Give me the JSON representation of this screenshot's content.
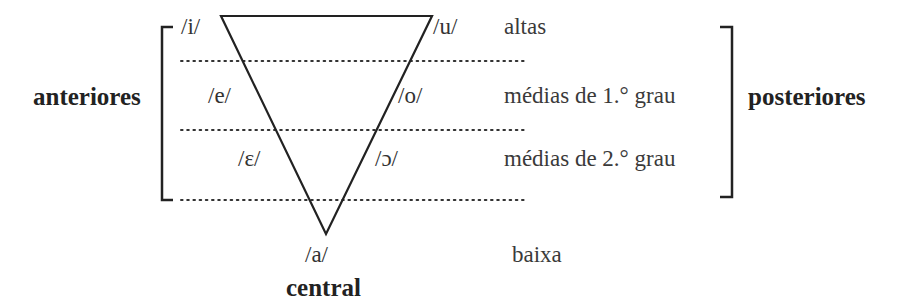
{
  "diagram": {
    "side_labels": {
      "left": "anteriores",
      "right": "posteriores",
      "bottom": "central"
    },
    "vowels": {
      "i": "/i/",
      "u": "/u/",
      "e": "/e/",
      "o": "/o/",
      "open_e": "/ɛ/",
      "open_o": "/ɔ/",
      "a": "/a/"
    },
    "height_labels": {
      "high": "altas",
      "mid_high": "médias de 1.° grau",
      "mid_low": "médias de 2.° grau",
      "low": "baixa"
    },
    "colors": {
      "line": "#222222",
      "text": "#2b2b2b"
    }
  }
}
